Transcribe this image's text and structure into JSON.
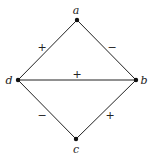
{
  "diagram": {
    "vertices": [
      {
        "id": "a",
        "label": "a",
        "x": 77,
        "y": 20,
        "lx": 76,
        "ly": 14
      },
      {
        "id": "b",
        "label": "b",
        "x": 136,
        "y": 80,
        "lx": 144,
        "ly": 84
      },
      {
        "id": "c",
        "label": "c",
        "x": 76,
        "y": 139,
        "lx": 76,
        "ly": 153
      },
      {
        "id": "d",
        "label": "d",
        "x": 18,
        "y": 80,
        "lx": 9,
        "ly": 84
      }
    ],
    "edges": [
      {
        "from": "a",
        "to": "d",
        "sign": "+",
        "sx": 42,
        "sy": 51
      },
      {
        "from": "a",
        "to": "b",
        "sign": "−",
        "sx": 112,
        "sy": 51
      },
      {
        "from": "d",
        "to": "b",
        "sign": "+",
        "sx": 77,
        "sy": 78
      },
      {
        "from": "d",
        "to": "c",
        "sign": "−",
        "sx": 42,
        "sy": 119
      },
      {
        "from": "c",
        "to": "b",
        "sign": "+",
        "sx": 110,
        "sy": 119
      }
    ],
    "colors": {
      "stroke": "#222222",
      "node": "#111111",
      "background": "#ffffff"
    }
  }
}
